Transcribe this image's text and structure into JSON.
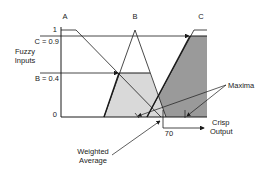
{
  "diagram": {
    "sets": [
      {
        "name": "A",
        "label": "A"
      },
      {
        "name": "B",
        "label": "B"
      },
      {
        "name": "C",
        "label": "C"
      }
    ],
    "y_axis": {
      "label_line1": "Fuzzy",
      "label_line2": "Inputs",
      "tick_one": "1",
      "tick_zero": "0",
      "level_c": "C = 0.9",
      "level_b": "B = 0.4",
      "c_value": 0.9,
      "b_value": 0.4
    },
    "annotations": {
      "maxima": "Maxima",
      "weighted_line1": "Weighted",
      "weighted_line2": "Average",
      "crisp_line1": "Crisp",
      "crisp_line2": "Output",
      "crisp_value": "70"
    },
    "colors": {
      "line": "#1a1a1a",
      "b_fill": "#d9d9d9",
      "c_fill": "#9a9a9a",
      "background": "#ffffff"
    }
  }
}
